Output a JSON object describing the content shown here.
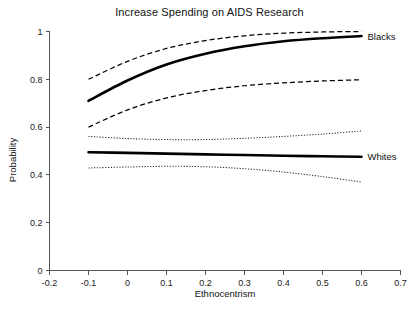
{
  "chart_data": {
    "type": "line",
    "title": "Increase Spending on AIDS Research",
    "xlabel": "Ethnocentrism",
    "ylabel": "Probability",
    "xlim": [
      -0.2,
      0.7
    ],
    "ylim": [
      0,
      1
    ],
    "xticks": [
      "-0.2",
      "-0.1",
      "0",
      "0.1",
      "0.2",
      "0.3",
      "0.4",
      "0.5",
      "0.6",
      "0.7"
    ],
    "xtick_values": [
      -0.2,
      -0.1,
      0,
      0.1,
      0.2,
      0.3,
      0.4,
      0.5,
      0.6,
      0.7
    ],
    "yticks": [
      "0",
      "0.2",
      "0.4",
      "0.6",
      "0.8",
      "1"
    ],
    "ytick_values": [
      0,
      0.2,
      0.4,
      0.6,
      0.8,
      1
    ],
    "grid": false,
    "legend_position": "right-inline-labels",
    "x": [
      -0.1,
      0.0,
      0.1,
      0.2,
      0.3,
      0.4,
      0.5,
      0.6
    ],
    "series": [
      {
        "name": "Blacks",
        "style": "solid-bold",
        "color": "#000000",
        "label_text": "Blacks",
        "values": [
          0.71,
          0.795,
          0.862,
          0.907,
          0.938,
          0.959,
          0.972,
          0.981
        ]
      },
      {
        "name": "Blacks upper CI",
        "style": "dashed",
        "color": "#000000",
        "label_text": "",
        "values": [
          0.8,
          0.875,
          0.929,
          0.962,
          0.982,
          0.993,
          0.998,
          1.0
        ]
      },
      {
        "name": "Blacks lower CI",
        "style": "dashed",
        "color": "#000000",
        "label_text": "",
        "values": [
          0.6,
          0.672,
          0.722,
          0.753,
          0.773,
          0.785,
          0.793,
          0.798
        ]
      },
      {
        "name": "Whites",
        "style": "solid-bold",
        "color": "#000000",
        "label_text": "Whites",
        "values": [
          0.495,
          0.492,
          0.489,
          0.486,
          0.483,
          0.48,
          0.478,
          0.476
        ]
      },
      {
        "name": "Whites upper CI",
        "style": "dotted",
        "color": "#2b2b2b",
        "label_text": "",
        "values": [
          0.561,
          0.552,
          0.548,
          0.548,
          0.553,
          0.561,
          0.571,
          0.584
        ]
      },
      {
        "name": "Whites lower CI",
        "style": "dotted",
        "color": "#2b2b2b",
        "label_text": "",
        "values": [
          0.429,
          0.433,
          0.436,
          0.434,
          0.426,
          0.412,
          0.393,
          0.37
        ]
      }
    ],
    "annotations": [
      {
        "text": "Blacks",
        "x": 0.6,
        "y": 0.98
      },
      {
        "text": "Whites",
        "x": 0.6,
        "y": 0.476
      }
    ]
  }
}
